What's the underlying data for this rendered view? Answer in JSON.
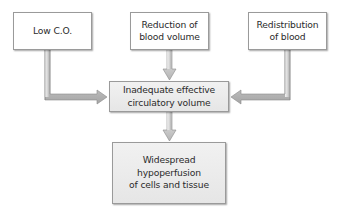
{
  "diagram": {
    "type": "flowchart",
    "nodes": {
      "low_co": {
        "id": "low-co",
        "label": "Low C.O."
      },
      "reduction": {
        "id": "reduction-blood-volume",
        "label": "Reduction of\nblood volume"
      },
      "redistribution": {
        "id": "redistribution-blood",
        "label": "Redistribution\nof blood"
      },
      "inadequate": {
        "id": "inadequate-circulatory-volume",
        "label": "Inadequate effective\ncirculatory volume"
      },
      "hypoperfusion": {
        "id": "widespread-hypoperfusion",
        "label": "Widespread\nhypoperfusion\nof cells and tissue"
      }
    },
    "edges": [
      {
        "from": "low-co",
        "to": "inadequate-circulatory-volume"
      },
      {
        "from": "reduction-blood-volume",
        "to": "inadequate-circulatory-volume"
      },
      {
        "from": "redistribution-blood",
        "to": "inadequate-circulatory-volume"
      },
      {
        "from": "inadequate-circulatory-volume",
        "to": "widespread-hypoperfusion"
      }
    ],
    "colors": {
      "box_border": "#9a9a9a",
      "box_fill": "#ffffff",
      "shaded_fill": "#ececec",
      "arrow_light": "#e8e8e8",
      "arrow_dark": "#9d9d9d",
      "arrow_outline": "#8a8a8a",
      "text": "#2b2b2b"
    }
  }
}
